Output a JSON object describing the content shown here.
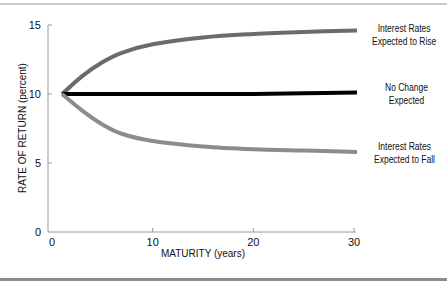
{
  "chart_data": {
    "type": "line",
    "title": "",
    "xlabel": "MATURITY (years)",
    "ylabel": "RATE OF RETURN (percent)",
    "xlim": [
      0,
      30
    ],
    "ylim": [
      0,
      15
    ],
    "xticks": [
      0,
      10,
      20,
      30
    ],
    "yticks": [
      0,
      5,
      10,
      15
    ],
    "grid": false,
    "legend_position": "right, inline labels at line ends",
    "x": [
      1,
      3,
      5,
      7,
      10,
      15,
      20,
      25,
      30
    ],
    "series": [
      {
        "name": "Interest Rates Expected to Rise",
        "label_line1": "Interest Rates",
        "label_line2": "Expected to Rise",
        "color": "#6b6b6b",
        "values": [
          10.0,
          11.3,
          12.3,
          13.0,
          13.6,
          14.1,
          14.35,
          14.5,
          14.6
        ]
      },
      {
        "name": "No Change Expected",
        "label_line1": "No Change",
        "label_line2": "Expected",
        "color": "#000000",
        "values": [
          10.0,
          10.0,
          10.0,
          10.0,
          10.0,
          10.0,
          10.0,
          10.05,
          10.1
        ]
      },
      {
        "name": "Interest Rates Expected to Fall",
        "label_line1": "Interest Rates",
        "label_line2": "Expected to Fall",
        "color": "#8c8c8c",
        "values": [
          10.0,
          8.8,
          7.8,
          7.1,
          6.6,
          6.2,
          6.0,
          5.9,
          5.8
        ]
      }
    ]
  }
}
